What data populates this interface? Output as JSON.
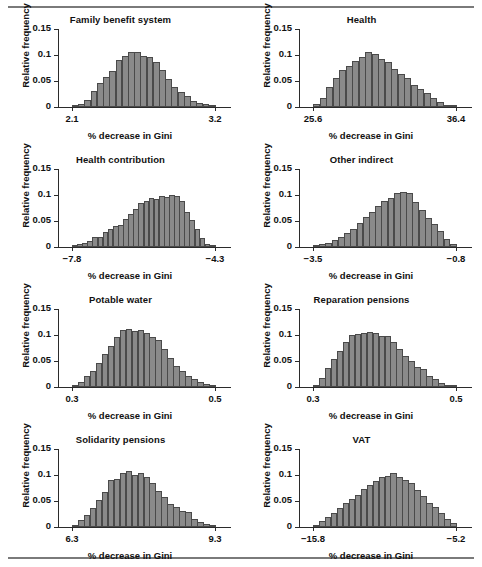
{
  "figure": {
    "axis_ylabel": "Relative frequency",
    "axis_xlabel": "% decrease in Gini",
    "y_ticks": [
      "0",
      "0.05",
      "0.1",
      "0.15"
    ],
    "y_tick_values": [
      0,
      0.05,
      0.1,
      0.15
    ],
    "ylim": [
      0,
      0.15
    ],
    "bar_fill": "#8a8a8a",
    "bar_stroke": "#4a4a4a",
    "rule_color": "#7a7a7a"
  },
  "chart_data": [
    {
      "type": "bar",
      "title": "Family benefit system",
      "xlabel": "% decrease in Gini",
      "ylabel": "Relative frequency",
      "xlim": [
        2.1,
        3.2
      ],
      "ylim": [
        0,
        0.15
      ],
      "xtick_labels": [
        "2.1",
        "3.2"
      ],
      "xtick_values": [
        2.1,
        3.2
      ],
      "ytick_labels": [
        "0",
        "0.05",
        "0.1",
        "0.15"
      ],
      "grid": false,
      "legend": "none",
      "bin_start": 2.1,
      "bin_width": 0.0478,
      "values": [
        0.002,
        0.005,
        0.013,
        0.03,
        0.046,
        0.057,
        0.069,
        0.09,
        0.099,
        0.106,
        0.106,
        0.098,
        0.097,
        0.086,
        0.072,
        0.054,
        0.039,
        0.029,
        0.021,
        0.012,
        0.008,
        0.005,
        0.002
      ]
    },
    {
      "type": "bar",
      "title": "Health",
      "xlabel": "% decrease in Gini",
      "ylabel": "Relative frequency",
      "xlim": [
        25.6,
        36.4
      ],
      "ylim": [
        0,
        0.15
      ],
      "xtick_labels": [
        "25.6",
        "36.4"
      ],
      "xtick_values": [
        25.6,
        36.4
      ],
      "ytick_labels": [
        "0",
        "0.05",
        "0.1",
        "0.15"
      ],
      "grid": false,
      "legend": "none",
      "bin_start": 25.6,
      "bin_width": 0.47,
      "values": [
        0.006,
        0.017,
        0.038,
        0.055,
        0.071,
        0.078,
        0.089,
        0.097,
        0.105,
        0.101,
        0.092,
        0.086,
        0.074,
        0.063,
        0.055,
        0.043,
        0.035,
        0.026,
        0.017,
        0.01,
        0.004,
        0.002
      ]
    },
    {
      "type": "bar",
      "title": "Health contribution",
      "xlabel": "% decrease in Gini",
      "ylabel": "Relative frequency",
      "xlim": [
        -7.8,
        -4.3
      ],
      "ylim": [
        0,
        0.15
      ],
      "xtick_labels": [
        "−7.8",
        "−4.3"
      ],
      "xtick_values": [
        -7.8,
        -4.3
      ],
      "ytick_labels": [
        "0",
        "0.05",
        "0.1",
        "0.15"
      ],
      "grid": false,
      "legend": "none",
      "bin_start": -7.8,
      "bin_width": 0.125,
      "values": [
        0.002,
        0.005,
        0.007,
        0.011,
        0.019,
        0.02,
        0.029,
        0.035,
        0.04,
        0.043,
        0.054,
        0.063,
        0.074,
        0.085,
        0.088,
        0.095,
        0.093,
        0.098,
        0.097,
        0.1,
        0.099,
        0.089,
        0.067,
        0.052,
        0.034,
        0.018,
        0.006,
        0.002
      ]
    },
    {
      "type": "bar",
      "title": "Other indirect",
      "xlabel": "% decrease in Gini",
      "ylabel": "Relative frequency",
      "xlim": [
        -3.5,
        -0.8
      ],
      "ylim": [
        0,
        0.15
      ],
      "xtick_labels": [
        "−3.5",
        "−0.8"
      ],
      "xtick_values": [
        -3.5,
        -0.8
      ],
      "ytick_labels": [
        "0",
        "0.05",
        "0.1",
        "0.15"
      ],
      "grid": false,
      "legend": "none",
      "bin_start": -3.5,
      "bin_width": 0.117,
      "values": [
        0.002,
        0.006,
        0.008,
        0.013,
        0.019,
        0.026,
        0.035,
        0.046,
        0.058,
        0.068,
        0.079,
        0.088,
        0.095,
        0.104,
        0.106,
        0.103,
        0.086,
        0.072,
        0.056,
        0.044,
        0.03,
        0.015,
        0.005
      ]
    },
    {
      "type": "bar",
      "title": "Potable water",
      "xlabel": "% decrease in Gini",
      "ylabel": "Relative frequency",
      "xlim": [
        0.3,
        0.5
      ],
      "ylim": [
        0,
        0.15
      ],
      "xtick_labels": [
        "0.3",
        "0.5"
      ],
      "xtick_values": [
        0.3,
        0.5
      ],
      "ytick_labels": [
        "0",
        "0.05",
        "0.1",
        "0.15"
      ],
      "grid": false,
      "legend": "none",
      "bin_start": 0.3,
      "bin_width": 0.0087,
      "values": [
        0.003,
        0.01,
        0.021,
        0.03,
        0.047,
        0.063,
        0.078,
        0.096,
        0.11,
        0.111,
        0.107,
        0.109,
        0.104,
        0.097,
        0.09,
        0.073,
        0.056,
        0.041,
        0.03,
        0.022,
        0.016,
        0.01,
        0.005,
        0.002
      ]
    },
    {
      "type": "bar",
      "title": "Reparation pensions",
      "xlabel": "% decrease in Gini",
      "ylabel": "Relative frequency",
      "xlim": [
        0.3,
        0.5
      ],
      "ylim": [
        0,
        0.15
      ],
      "xtick_labels": [
        "0.3",
        "0.5"
      ],
      "xtick_values": [
        0.3,
        0.5
      ],
      "ytick_labels": [
        "0",
        "0.05",
        "0.1",
        "0.15"
      ],
      "grid": false,
      "legend": "none",
      "bin_start": 0.3,
      "bin_width": 0.0087,
      "values": [
        0.002,
        0.017,
        0.037,
        0.053,
        0.07,
        0.087,
        0.1,
        0.101,
        0.104,
        0.106,
        0.104,
        0.099,
        0.098,
        0.086,
        0.073,
        0.06,
        0.05,
        0.039,
        0.035,
        0.021,
        0.015,
        0.008,
        0.004,
        0.002
      ]
    },
    {
      "type": "bar",
      "title": "Solidarity pensions",
      "xlabel": "% decrease in Gini",
      "ylabel": "Relative frequency",
      "xlim": [
        6.3,
        9.3
      ],
      "ylim": [
        0,
        0.15
      ],
      "xtick_labels": [
        "6.3",
        "9.3"
      ],
      "xtick_values": [
        6.3,
        9.3
      ],
      "ytick_labels": [
        "0",
        "0.05",
        "0.1",
        "0.15"
      ],
      "grid": false,
      "legend": "none",
      "bin_start": 6.3,
      "bin_width": 0.125,
      "values": [
        0.004,
        0.013,
        0.023,
        0.036,
        0.052,
        0.068,
        0.09,
        0.092,
        0.104,
        0.107,
        0.1,
        0.103,
        0.096,
        0.085,
        0.069,
        0.057,
        0.044,
        0.039,
        0.03,
        0.028,
        0.016,
        0.01,
        0.006,
        0.003
      ]
    },
    {
      "type": "bar",
      "title": "VAT",
      "xlabel": "% decrease in Gini",
      "ylabel": "Relative frequency",
      "xlim": [
        -15.8,
        -5.2
      ],
      "ylim": [
        0,
        0.15
      ],
      "xtick_labels": [
        "−15.8",
        "−5.2"
      ],
      "xtick_values": [
        -15.8,
        -5.2
      ],
      "ytick_labels": [
        "0",
        "0.05",
        "0.1",
        "0.15"
      ],
      "grid": false,
      "legend": "none",
      "bin_start": -15.8,
      "bin_width": 0.46,
      "values": [
        0.004,
        0.011,
        0.019,
        0.027,
        0.036,
        0.046,
        0.054,
        0.061,
        0.073,
        0.08,
        0.089,
        0.096,
        0.099,
        0.104,
        0.096,
        0.09,
        0.084,
        0.071,
        0.06,
        0.047,
        0.038,
        0.026,
        0.015,
        0.007
      ]
    }
  ]
}
